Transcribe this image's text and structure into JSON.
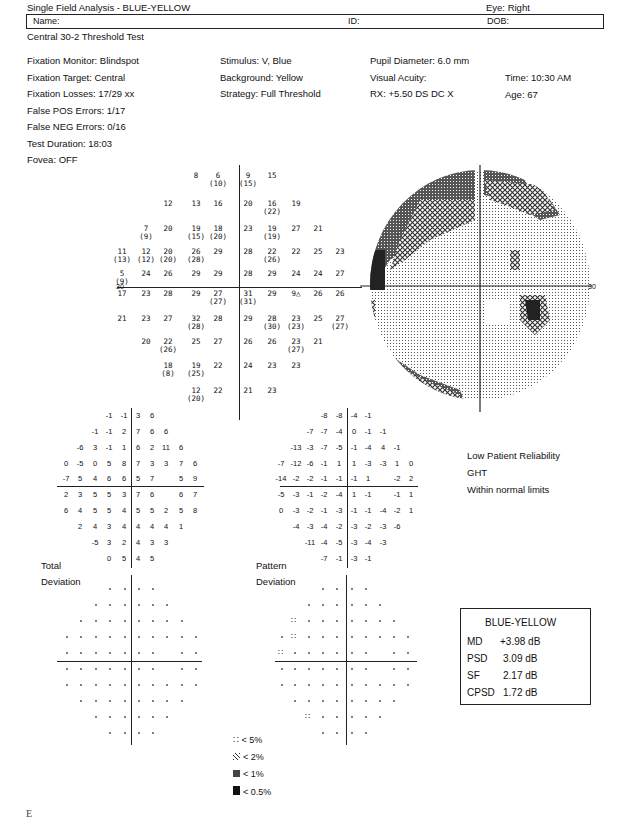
{
  "header": {
    "title": "Single Field Analysis - BLUE-YELLOW",
    "eye": "Eye: Right",
    "name_label": "Name:",
    "id_label": "ID:",
    "dob_label": "DOB:",
    "test_name": "Central 30-2 Threshold Test"
  },
  "info": {
    "col1": [
      "Fixation Monitor: Blindspot",
      "Fixation Target: Central",
      "Fixation Losses: 17/29 xx",
      "False POS Errors: 1/17",
      "False NEG Errors: 0/16",
      "Test Duration: 18:03",
      "Fovea: OFF"
    ],
    "col2": [
      "Stimulus: V, Blue",
      "Background: Yellow",
      "Strategy: Full Threshold"
    ],
    "col3": [
      "Pupil Diameter: 6.0 mm",
      "Visual Acuity:",
      "RX: +5.50 DS        DC  X"
    ],
    "col4": [
      "Time: 10:30 AM",
      "Age: 67"
    ]
  },
  "threshold": {
    "axis_label_left": "30",
    "axis_label_right": "30",
    "rows": [
      [
        null,
        null,
        null,
        "8",
        "6 (10)",
        "9 (15)",
        "15",
        null,
        null,
        null
      ],
      [
        null,
        null,
        "12",
        "13",
        "16",
        "20",
        "16 (22)",
        "19",
        null,
        null
      ],
      [
        null,
        "7 (9)",
        "20",
        "19 (15)",
        "18 (20)",
        "23",
        "19 (19)",
        "27",
        "21",
        null
      ],
      [
        "11 (13)",
        "12 (12)",
        "20 (20)",
        "26 (28)",
        "29",
        "28",
        "22 (26)",
        "22",
        "25",
        "23"
      ],
      [
        "5 (9)",
        "24",
        "26",
        "29",
        "29",
        "28",
        "29",
        "24",
        "24",
        "27"
      ],
      [
        "17",
        "23",
        "28",
        "29",
        "27 (27)",
        "31 (31)",
        "29",
        "9△",
        "26",
        "26"
      ],
      [
        "21",
        "23",
        "27",
        "32 (28)",
        "28",
        "29",
        "28 (30)",
        "23 (23)",
        "25",
        "27 (27)"
      ],
      [
        null,
        "20",
        "22 (26)",
        "25",
        "27",
        "26",
        "26",
        "23 (27)",
        "21",
        null
      ],
      [
        null,
        null,
        "18 (8)",
        "19 (25)",
        "22",
        "24",
        "23",
        "23",
        null,
        null
      ],
      [
        null,
        null,
        null,
        "12 (20)",
        "22",
        "21",
        "23",
        null,
        null,
        null
      ]
    ]
  },
  "total_deviation": {
    "label1": "Total",
    "label2": "Deviation",
    "rows": [
      [
        null,
        null,
        null,
        "-1",
        "-1",
        "3",
        "6",
        null,
        null,
        null
      ],
      [
        null,
        null,
        "-1",
        "-1",
        "2",
        "7",
        "6",
        "6",
        null,
        null
      ],
      [
        null,
        "-6",
        "3",
        "-1",
        "1",
        "6",
        "2",
        "11",
        "6",
        null
      ],
      [
        "0",
        "-5",
        "0",
        "5",
        "8",
        "7",
        "3",
        "3",
        "7",
        "6"
      ],
      [
        "-7",
        "5",
        "4",
        "6",
        "6",
        "5",
        "7",
        "",
        "5",
        "9"
      ],
      [
        "2",
        "3",
        "5",
        "5",
        "3",
        "7",
        "6",
        "",
        "6",
        "7"
      ],
      [
        "6",
        "4",
        "5",
        "5",
        "4",
        "5",
        "5",
        "2",
        "5",
        "8"
      ],
      [
        null,
        "2",
        "4",
        "3",
        "4",
        "4",
        "4",
        "4",
        "1",
        null
      ],
      [
        null,
        null,
        "-5",
        "3",
        "2",
        "4",
        "3",
        "3",
        null,
        null
      ],
      [
        null,
        null,
        null,
        "0",
        "5",
        "4",
        "5",
        null,
        null,
        null
      ]
    ]
  },
  "pattern_deviation": {
    "label1": "Pattern",
    "label2": "Deviation",
    "rows": [
      [
        null,
        null,
        null,
        "-8",
        "-8",
        "-4",
        "-1",
        null,
        null,
        null
      ],
      [
        null,
        null,
        "-7",
        "-7",
        "-4",
        "0",
        "-1",
        "-1",
        null,
        null
      ],
      [
        null,
        "-13",
        "-3",
        "-7",
        "-5",
        "-1",
        "-4",
        "4",
        "-1",
        null
      ],
      [
        "-7",
        "-12",
        "-6",
        "-1",
        "1",
        "1",
        "-3",
        "-3",
        "1",
        "0"
      ],
      [
        "-14",
        "-2",
        "-2",
        "-1",
        "-1",
        "-1",
        "1",
        "",
        "-2",
        "2"
      ],
      [
        "-5",
        "-3",
        "-1",
        "-2",
        "-4",
        "1",
        "-1",
        "",
        "-1",
        "1"
      ],
      [
        "0",
        "-3",
        "-2",
        "-1",
        "-3",
        "-1",
        "-1",
        "-4",
        "-2",
        "1"
      ],
      [
        null,
        "-4",
        "-3",
        "-4",
        "-2",
        "-3",
        "-2",
        "-3",
        "-6",
        null
      ],
      [
        null,
        null,
        "-11",
        "-4",
        "-5",
        "-3",
        "-4",
        "-3",
        null,
        null
      ],
      [
        null,
        null,
        null,
        "-7",
        "-1",
        "-3",
        "-1",
        null,
        null,
        null
      ]
    ]
  },
  "ght": {
    "reliability": "Low Patient Reliability",
    "label": "GHT",
    "result": "Within normal limits"
  },
  "global_indices": {
    "title": "BLUE-YELLOW",
    "rows": [
      {
        "label": "MD",
        "value": "+3.98 dB"
      },
      {
        "label": "PSD",
        "value": "3.09 dB"
      },
      {
        "label": "SF",
        "value": "2.17 dB"
      },
      {
        "label": "CPSD",
        "value": "1.72 dB"
      }
    ]
  },
  "legend": [
    {
      "symbol": "dots",
      "label": "< 5%"
    },
    {
      "symbol": "hatch",
      "label": "< 2%"
    },
    {
      "symbol": "dense",
      "label": "< 1%"
    },
    {
      "symbol": "solid",
      "label": "< 0.5%"
    }
  ],
  "footer_letter": "E"
}
